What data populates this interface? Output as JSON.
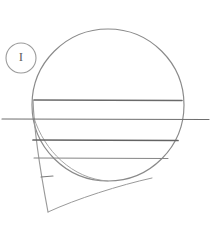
{
  "figure": {
    "canvas": {
      "width": 211,
      "height": 228,
      "background": "#ffffff"
    },
    "stroke_colors": {
      "outline": "#8a8a8a",
      "chord_line": "#6a6a6a",
      "tail": "#9a9a9a",
      "callout": "#9b9b9b",
      "callout_text": "#5f5f5f"
    },
    "callout": {
      "label": "I",
      "shape": "ellipse",
      "center": {
        "x": 21,
        "y": 58
      },
      "radius": {
        "x": 15,
        "y": 15
      }
    },
    "circle": {
      "name": "main-circle",
      "center": {
        "x": 108,
        "y": 105
      },
      "radius": 76,
      "bounds": {
        "top": 29,
        "bottom": 181,
        "left": 32,
        "right": 184
      }
    },
    "chords": [
      {
        "name": "chord-1",
        "y": 100,
        "x1": 34,
        "x2": 182,
        "extends_beyond": false,
        "weight": 1.5
      },
      {
        "name": "chord-2",
        "y": 119,
        "x1": 2,
        "x2": 209,
        "extends_beyond": true,
        "weight": 1.2
      },
      {
        "name": "chord-3",
        "y": 140,
        "x1": 33,
        "x2": 178,
        "extends_beyond": false,
        "weight": 1.6
      },
      {
        "name": "chord-4",
        "y": 158,
        "x1": 34,
        "x2": 168,
        "extends_beyond": false,
        "weight": 1.0
      }
    ],
    "tail": {
      "name": "teardrop-tail",
      "apex": {
        "x": 48,
        "y": 212
      },
      "left_start": {
        "x": 33,
        "y": 100
      },
      "right_end": {
        "x": 152,
        "y": 178
      }
    },
    "tick_mark": {
      "name": "tick-mark",
      "x1": 41,
      "y1": 177,
      "x2": 53,
      "y2": 176
    }
  }
}
